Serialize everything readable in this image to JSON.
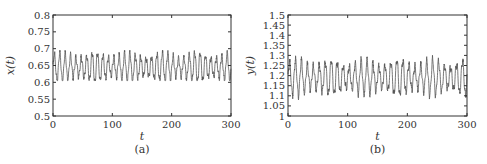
{
  "chart_data": [
    {
      "id": "a",
      "type": "line",
      "caption": "(a)",
      "xlabel": "t",
      "ylabel": "x(t)",
      "xlim": [
        0,
        300
      ],
      "ylim": [
        0.5,
        0.8
      ],
      "xticks": [
        0,
        100,
        200,
        300
      ],
      "xtick_labels": [
        "0",
        "100",
        "200",
        "300"
      ],
      "yticks": [
        0.5,
        0.55,
        0.6,
        0.65,
        0.7,
        0.75,
        0.8
      ],
      "ytick_labels": [
        "0.5",
        "0.55",
        "0.6",
        "0.65",
        "0.7",
        "0.75",
        "0.8"
      ],
      "grid": false,
      "legend": null,
      "series": [
        {
          "name": "x(t)",
          "color": "#555555",
          "description": "Rapid quasi-periodic oscillation, period ≈ 9, mean ≈ 0.645, amplitude ≈ 0.035, occasional peaks to ≈ 0.695 and troughs to ≈ 0.605",
          "mean": 0.645,
          "amplitude": 0.035,
          "period": 9.1,
          "min": 0.605,
          "max": 0.695
        }
      ]
    },
    {
      "id": "b",
      "type": "line",
      "caption": "(b)",
      "xlabel": "t",
      "ylabel": "y(t)",
      "xlim": [
        0,
        300
      ],
      "ylim": [
        1.0,
        1.5
      ],
      "xticks": [
        0,
        100,
        200,
        300
      ],
      "xtick_labels": [
        "0",
        "100",
        "200",
        "300"
      ],
      "yticks": [
        1.0,
        1.05,
        1.1,
        1.15,
        1.2,
        1.25,
        1.3,
        1.35,
        1.4,
        1.45,
        1.5
      ],
      "ytick_labels": [
        "1",
        "1.05",
        "1.1",
        "1.15",
        "1.2",
        "1.25",
        "1.3",
        "1.35",
        "1.4",
        "1.45",
        "1.5"
      ],
      "grid": false,
      "legend": null,
      "series": [
        {
          "name": "y(t)",
          "color": "#555555",
          "description": "Rapid quasi-periodic oscillation, period ≈ 10, mean ≈ 1.19, amplitude ≈ 0.07, occasional peaks to ≈ 1.31 and troughs to ≈ 1.08",
          "mean": 1.19,
          "amplitude": 0.07,
          "period": 10.0,
          "min": 1.08,
          "max": 1.31
        }
      ]
    }
  ]
}
